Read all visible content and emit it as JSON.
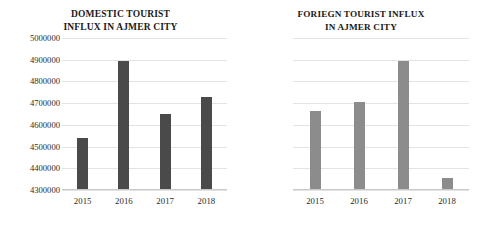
{
  "figure": {
    "background": "#ffffff",
    "panels": [
      "domestic",
      "foreign"
    ]
  },
  "domestic": {
    "title_line1": "DOMESTIC TOURIST",
    "title_line2": "INFLUX IN AJMER CITY",
    "bar_color": "#4a4a4a",
    "grid_color": "#e3e3e3",
    "yticks": [
      "5000000",
      "4900000",
      "4800000",
      "4700000",
      "4600000",
      "4500000",
      "4400000",
      "4300000"
    ],
    "xticks": [
      "2015",
      "2016",
      "2017",
      "2018"
    ]
  },
  "foreign": {
    "title_line1": "FORIEGN TOURIST INFLUX",
    "title_line2": "IN AJMER CITY",
    "bar_color": "#8c8c8c",
    "grid_color": "#e3e3e3",
    "yticks": [
      "70000",
      "60000",
      "50000",
      "40000",
      "30000",
      "20000",
      "10000",
      "0"
    ],
    "xticks": [
      "2015",
      "2016",
      "2017",
      "2018"
    ]
  },
  "chart_data": [
    {
      "type": "bar",
      "title": "DOMESTIC TOURIST INFLUX IN AJMER CITY",
      "xlabel": "",
      "ylabel": "",
      "categories": [
        "2015",
        "2016",
        "2017",
        "2018"
      ],
      "values": [
        4540000,
        4895000,
        4650000,
        4730000
      ],
      "ylim": [
        4300000,
        5000000
      ],
      "ytick_values": [
        4300000,
        4400000,
        4500000,
        4600000,
        4700000,
        4800000,
        4900000,
        5000000
      ],
      "ytick_step": 100000,
      "grid": true,
      "legend": null,
      "bar_color": "#4a4a4a"
    },
    {
      "type": "bar",
      "title": "FORIEGN TOURIST INFLUX IN AJMER CITY",
      "xlabel": "",
      "ylabel": "",
      "categories": [
        "2015",
        "2016",
        "2017",
        "2018"
      ],
      "values": [
        36500,
        40500,
        59500,
        5500
      ],
      "ylim": [
        0,
        70000
      ],
      "ytick_values": [
        0,
        10000,
        20000,
        30000,
        40000,
        50000,
        60000,
        70000
      ],
      "ytick_step": 10000,
      "grid": true,
      "legend": null,
      "bar_color": "#8c8c8c"
    }
  ]
}
